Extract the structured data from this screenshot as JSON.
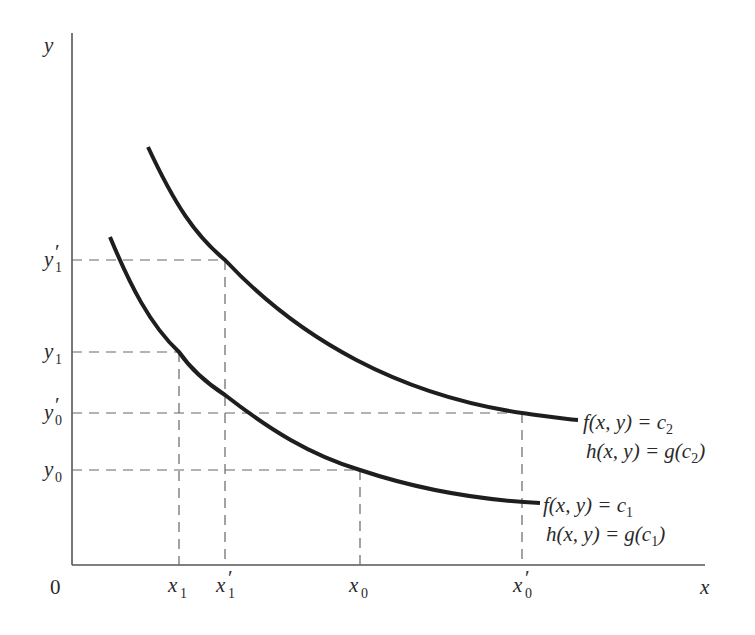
{
  "diagram": {
    "axes": {
      "origin_label": "0",
      "x_label": "x",
      "y_label": "y"
    },
    "x_ticks": [
      {
        "base": "x",
        "sub": "1",
        "prime": false,
        "px": 179
      },
      {
        "base": "x",
        "sub": "1",
        "prime": true,
        "px": 225
      },
      {
        "base": "x",
        "sub": "0",
        "prime": false,
        "px": 360
      },
      {
        "base": "x",
        "sub": "0",
        "prime": true,
        "px": 522
      }
    ],
    "y_ticks": [
      {
        "base": "y",
        "sub": "1",
        "prime": true,
        "py": 260
      },
      {
        "base": "y",
        "sub": "1",
        "prime": false,
        "py": 352
      },
      {
        "base": "y",
        "sub": "0",
        "prime": true,
        "py": 413
      },
      {
        "base": "y",
        "sub": "0",
        "prime": false,
        "py": 470
      }
    ],
    "curves": [
      {
        "name": "upper-level-curve",
        "label_line1": "f(x, y) = c",
        "label_line1_sub": "2",
        "label_line2": "h(x, y) = g(c",
        "label_line2_sub": "2",
        "label_line2_end": ")"
      },
      {
        "name": "lower-level-curve",
        "label_line1": "f(x, y) = c",
        "label_line1_sub": "1",
        "label_line2": "h(x, y) = g(c",
        "label_line2_sub": "1",
        "label_line2_end": ")"
      }
    ],
    "colors": {
      "curve": "#1e1e1e",
      "axis": "#555555",
      "dash": "#666666",
      "text": "#2a2a2a"
    }
  }
}
